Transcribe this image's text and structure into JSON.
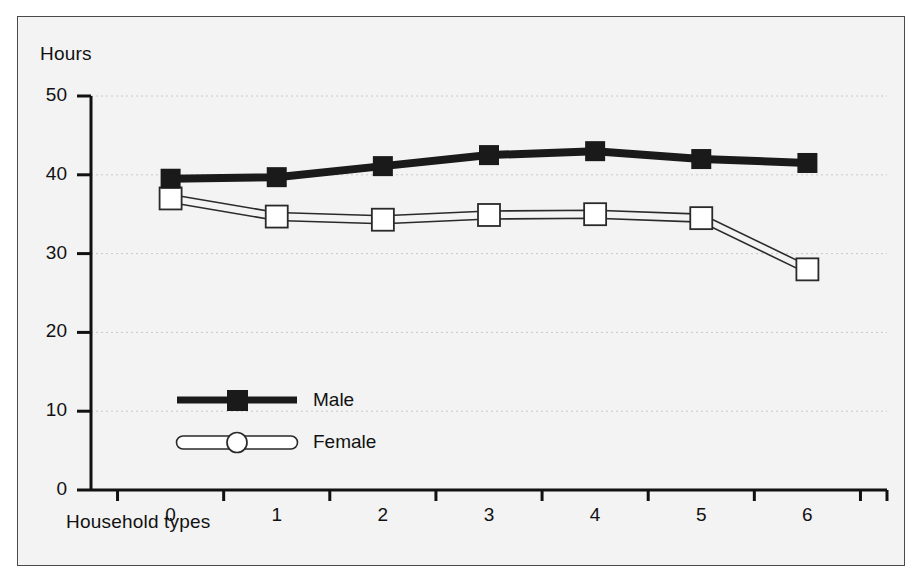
{
  "chart_data": {
    "type": "line",
    "title": "",
    "subtitle": "",
    "xlabel": "Household types",
    "ylabel": "Hours",
    "categories": [
      "0",
      "1",
      "2",
      "3",
      "4",
      "5",
      "6"
    ],
    "x": [
      0,
      1,
      2,
      3,
      4,
      5,
      6
    ],
    "xlim": [
      -0.5,
      6.5
    ],
    "ylim": [
      0,
      50
    ],
    "y_ticks": [
      0,
      10,
      20,
      30,
      40,
      50
    ],
    "x_ticks": [
      "0",
      "1",
      "2",
      "3",
      "4",
      "5",
      "6"
    ],
    "grid": "horizontal-dotted",
    "legend_position": "inside-lower-left",
    "series": [
      {
        "name": "Male",
        "values": [
          39.5,
          39.7,
          41.1,
          42.5,
          43.0,
          42.0,
          41.5
        ],
        "color": "#1a1a1a",
        "marker": "filled-square",
        "line_style": "thick-solid"
      },
      {
        "name": "Female",
        "values": [
          37.0,
          34.7,
          34.3,
          34.9,
          35.0,
          34.5,
          28.0
        ],
        "color": "#ffffff",
        "edge_color": "#2a2a2a",
        "marker": "open-square",
        "line_style": "outlined-band"
      }
    ]
  },
  "axes": {
    "y_title": "Hours",
    "x_title": "Household types",
    "y_tick_labels": [
      "50",
      "40",
      "30",
      "20",
      "10",
      "0"
    ],
    "x_tick_labels": [
      "0",
      "1",
      "2",
      "3",
      "4",
      "5",
      "6"
    ]
  },
  "legend": {
    "entries": [
      {
        "label": "Male",
        "marker": "filled-square-icon"
      },
      {
        "label": "Female",
        "marker": "open-circle-icon"
      }
    ]
  },
  "colors": {
    "background": "#f3f3f3",
    "frame": "#4a4a4a",
    "axis": "#111111",
    "grid": "#c8c8c8",
    "male": "#1a1a1a",
    "female_fill": "#ffffff",
    "female_edge": "#2a2a2a"
  }
}
